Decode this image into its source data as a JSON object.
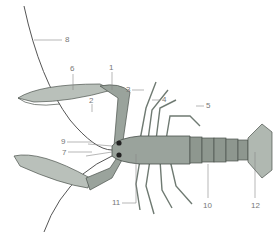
{
  "diagram": {
    "colors": {
      "body": "#9aa39c",
      "body_dark": "#6f7a72",
      "outline": "#4a524c",
      "label": "#777777",
      "leader": "#888888",
      "antenna": "#555555"
    },
    "labels": [
      {
        "id": "1",
        "text": "1",
        "x": 109,
        "y": 64
      },
      {
        "id": "2",
        "text": "2",
        "x": 89,
        "y": 97
      },
      {
        "id": "3",
        "text": "3",
        "x": 126,
        "y": 86
      },
      {
        "id": "4",
        "text": "4",
        "x": 163,
        "y": 98
      },
      {
        "id": "5",
        "text": "5",
        "x": 207,
        "y": 104
      },
      {
        "id": "6",
        "text": "6",
        "x": 70,
        "y": 66
      },
      {
        "id": "7",
        "text": "7",
        "x": 63,
        "y": 150
      },
      {
        "id": "8",
        "text": "8",
        "x": 65,
        "y": 37
      },
      {
        "id": "9",
        "text": "9",
        "x": 62,
        "y": 140
      },
      {
        "id": "10",
        "text": "10",
        "x": 204,
        "y": 203
      },
      {
        "id": "11",
        "text": "11",
        "x": 112,
        "y": 203
      },
      {
        "id": "12",
        "text": "12",
        "x": 253,
        "y": 203
      }
    ]
  }
}
